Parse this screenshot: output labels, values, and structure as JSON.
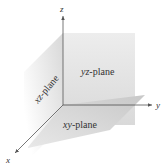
{
  "figure": {
    "axes": [
      {
        "name": "x",
        "label": "x"
      },
      {
        "name": "y",
        "label": "y"
      },
      {
        "name": "z",
        "label": "z"
      }
    ],
    "planes": [
      {
        "name": "yz-plane",
        "italic_part": "yz",
        "rest": "-plane"
      },
      {
        "name": "xz-plane",
        "italic_part": "xz",
        "rest": "-plane"
      },
      {
        "name": "xy-plane",
        "italic_part": "xy",
        "rest": "-plane"
      }
    ]
  },
  "colors": {
    "background": "#ffffff",
    "plane_light": "#e6e6e6",
    "plane_mid": "#d4d4d4",
    "plane_dark": "#c2c2c2",
    "axis": "#555555",
    "text": "#333333"
  }
}
